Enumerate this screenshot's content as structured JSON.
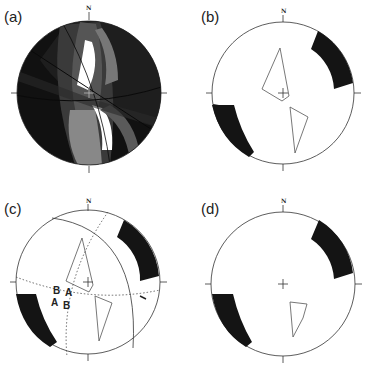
{
  "figure": {
    "type": "stereonet-panels",
    "panels": [
      {
        "id": "a",
        "label": "(a)",
        "north_label": "N",
        "description": "shaded great-circle overlay, dark to white regions"
      },
      {
        "id": "b",
        "label": "(b)",
        "north_label": "N",
        "description": "two black arc bands on primitive, two outlined polygons"
      },
      {
        "id": "c",
        "label": "(c)",
        "north_label": "N",
        "description": "bands, polygons, great circle and dotted lines with A/B labels",
        "annotations": [
          "B",
          "A",
          "A",
          "B"
        ]
      },
      {
        "id": "d",
        "label": "(d)",
        "north_label": "N",
        "description": "two black arc bands, single outlined polygon"
      }
    ]
  },
  "colors": {
    "stroke": "#333333",
    "band": "#141414",
    "background": "#ffffff"
  }
}
